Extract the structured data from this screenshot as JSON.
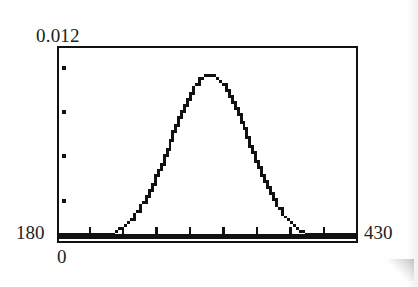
{
  "figure": {
    "kind": "graphing-calculator-plot",
    "background_color": "#ffffff",
    "ink_color": "#111111"
  },
  "labels": {
    "y_max": "0.012",
    "y_min": "0",
    "x_min": "180",
    "x_max": "430"
  },
  "axes": {
    "x_tick_count": 8,
    "y_tick_count": 4,
    "frame_border_color": "#111111"
  },
  "chart_data": {
    "type": "line",
    "title": "",
    "xlabel": "",
    "ylabel": "",
    "xlim": [
      180,
      430
    ],
    "ylim": [
      0,
      0.012
    ],
    "grid": false,
    "legend": null,
    "annotations": [],
    "axis_corner_labels": {
      "top_left": "0.012",
      "bottom_left_of_axis": "180",
      "below_origin": "0",
      "bottom_right": "430"
    },
    "x_tick_values": [
      205.6,
      233.3,
      261.1,
      288.9,
      316.7,
      344.4,
      372.2,
      400.0
    ],
    "y_tick_values": [
      0.0108,
      0.0081,
      0.0054,
      0.0027
    ],
    "distribution": {
      "shape": "normal",
      "mean": 305,
      "std_dev": 33,
      "peak_value": 0.0104
    },
    "x": [
      180,
      190,
      200,
      210,
      220,
      230,
      240,
      250,
      260,
      270,
      280,
      290,
      300,
      305,
      310,
      320,
      330,
      340,
      350,
      360,
      370,
      380,
      390,
      400,
      410,
      420,
      430
    ],
    "y": [
      6e-05,
      0.00018,
      0.00046,
      0.00104,
      0.00213,
      0.00392,
      0.00651,
      0.00974,
      0.0131,
      0.01586,
      0.01728,
      0.01694,
      0.01493,
      0.01331,
      0.01179,
      0.00837,
      0.00535,
      0.00308,
      0.0016,
      0.00074,
      0.00031,
      0.00012,
      4e-05,
      1e-05,
      3e-06,
      8e-07,
      2e-07
    ],
    "y_display_scale_note": "curve normalized so peak sits at ~0.0104 of the 0-0.012 axis"
  }
}
